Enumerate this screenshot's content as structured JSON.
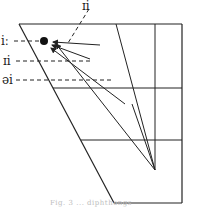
{
  "diagram": {
    "type": "vowel-quadrilateral",
    "labels": {
      "top": "ɪi",
      "i_long": "iː",
      "ii": "ɪi",
      "ai": "əi"
    },
    "caption": "Fig. 3 ... diphthongs",
    "colors": {
      "ink": "#222222",
      "background": "#ffffff"
    }
  }
}
